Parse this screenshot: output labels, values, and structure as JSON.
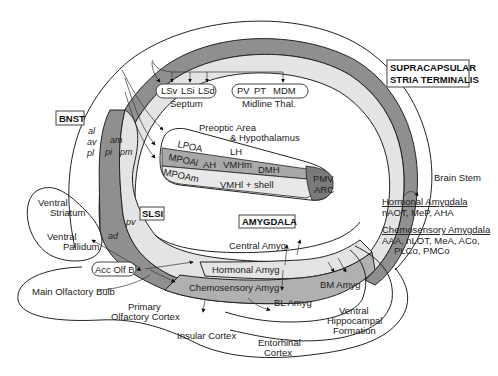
{
  "diagram": {
    "labels": {
      "bnst": "BNST",
      "supracapsular_line1": "SUPRACAPSULAR",
      "supracapsular_line2": "STRIA TERMINALIS",
      "slsi": "SLSI",
      "amygdala": "AMYGDALA"
    },
    "bnst_subdivisions": {
      "al": "al",
      "av": "av",
      "pl": "pl",
      "am": "am",
      "pi": "pi",
      "pm": "pm",
      "pv": "pv",
      "ad": "ad"
    },
    "septum": {
      "nuclei": [
        "LSv",
        "LSi",
        "LSd"
      ],
      "label": "Septum"
    },
    "midline_thal": {
      "nuclei": [
        "PV",
        "PT",
        "MDM"
      ],
      "label": "Midline Thal."
    },
    "hypothalamus": {
      "title_line1": "Preoptic Area",
      "title_line2": "& Hypothalamus",
      "lpoa": "LPOA",
      "lh": "LH",
      "mpoal": "MPOAl",
      "ah": "AH",
      "vmhm": "VMHm",
      "dmh": "DMH",
      "mpoam": "MPOAm",
      "vmhl": "VMHl + shell",
      "pmv": "PMV",
      "arc": "ARC"
    },
    "amygdala_regions": {
      "central": "Central Amyg",
      "hormonal": "Hormonal Amyg",
      "chemosensory": "Chemosensory Amyg",
      "bm": "BM Amyg",
      "bl": "BL Amyg"
    },
    "other_regions": {
      "brain_stem": "Brain Stem",
      "ventral_striatum_1": "Ventral",
      "ventral_striatum_2": "Striatum",
      "ventral_pallidum_1": "Ventral",
      "ventral_pallidum_2": "Pallidum",
      "acc_olf_b": "Acc Olf B",
      "main_olfactory_bulb": "Main Olfactory Bulb",
      "primary_olf_1": "Primary",
      "primary_olf_2": "Olfactory Cortex",
      "insular_cortex": "Insular Cortex",
      "entorhinal_1": "Entorhinal",
      "entorhinal_2": "Cortex",
      "vhf_1": "Ventral",
      "vhf_2": "Hippocampal",
      "vhf_3": "Formation"
    },
    "legend": {
      "hormonal_title": "Hormonal Amygdala",
      "hormonal_items": "nAOT, MeP, AHA",
      "chemo_title": "Chemosensory Amygdala",
      "chemo_items_1": "AAA, nLOT, MeA, ACo,",
      "chemo_items_2": "PLCo, PMCo"
    },
    "colors": {
      "dark_band": "#8f8f8f",
      "light_band": "#e2e2e2",
      "mid_band": "#b4b4b4",
      "line": "#222222",
      "background": "#ffffff"
    }
  }
}
